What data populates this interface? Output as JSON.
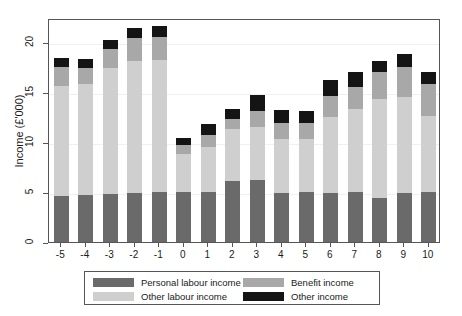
{
  "chart": {
    "type": "bar",
    "title": "",
    "ylabel": "Income (£'000)",
    "xlabel": ""
  },
  "chart_data": {
    "type": "bar",
    "stacked": true,
    "title": "",
    "xlabel": "",
    "ylabel": "Income (£'000)",
    "ylim": [
      0,
      22.5
    ],
    "yticks": [
      0,
      5,
      10,
      15,
      20
    ],
    "grid": false,
    "legend_position": "bottom",
    "categories": [
      "-5",
      "-4",
      "-3",
      "-2",
      "-1",
      "0",
      "1",
      "2",
      "3",
      "4",
      "5",
      "6",
      "7",
      "8",
      "9",
      "10"
    ],
    "series": [
      {
        "name": "Personal labour income",
        "color": "#6a6a6a",
        "values": [
          4.6,
          4.7,
          4.8,
          4.9,
          5.0,
          5.0,
          5.0,
          6.1,
          6.2,
          4.9,
          5.0,
          4.9,
          5.0,
          4.4,
          4.9,
          5.0
        ]
      },
      {
        "name": "Other labour income",
        "color": "#cfcfcf",
        "values": [
          11.0,
          11.1,
          12.6,
          13.2,
          13.2,
          3.8,
          4.5,
          5.2,
          5.3,
          5.4,
          5.3,
          7.6,
          8.3,
          9.9,
          9.6,
          7.6
        ]
      },
      {
        "name": "Benefit income",
        "color": "#a8a8a8",
        "values": [
          1.9,
          1.6,
          1.9,
          2.3,
          2.3,
          0.9,
          1.2,
          1.0,
          1.6,
          1.6,
          1.6,
          2.1,
          2.2,
          2.7,
          3.0,
          3.2
        ]
      },
      {
        "name": "Other income",
        "color": "#141414",
        "values": [
          0.9,
          0.9,
          0.9,
          1.0,
          1.1,
          0.7,
          1.1,
          1.0,
          1.6,
          1.3,
          1.2,
          1.6,
          1.5,
          1.1,
          1.3,
          1.2
        ]
      }
    ],
    "totals": [
      18.4,
      18.3,
      20.2,
      21.4,
      21.6,
      10.4,
      11.8,
      13.3,
      14.7,
      13.2,
      13.1,
      16.2,
      17.0,
      18.1,
      18.8,
      17.0
    ]
  },
  "legend": {
    "entries": [
      {
        "label": "Personal labour income",
        "color": "#6a6a6a"
      },
      {
        "label": "Benefit income",
        "color": "#a8a8a8"
      },
      {
        "label": "Other labour income",
        "color": "#cfcfcf"
      },
      {
        "label": "Other income",
        "color": "#141414"
      }
    ]
  }
}
